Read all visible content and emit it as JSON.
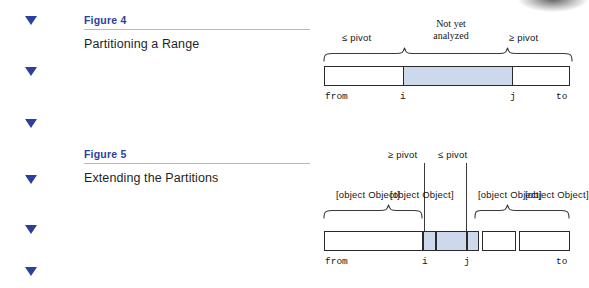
{
  "margin_markers": {
    "icon": "triangle-down-icon",
    "color": "#2b3f9e",
    "count": 6
  },
  "figures": [
    {
      "heading": "Figure 4",
      "title": "Partitioning a Range",
      "diagram": {
        "type": "partition-range-diagram",
        "top_labels": [
          {
            "text": "≤ pivot",
            "style": "sans"
          },
          {
            "text": "Not yet",
            "text2": "analyzed",
            "style": "serif"
          },
          {
            "text": "≥ pivot",
            "style": "sans"
          }
        ],
        "bottom_labels": [
          "from",
          "i",
          "j",
          "to"
        ],
        "segments": [
          {
            "name": "less-equal-pivot",
            "shaded": false
          },
          {
            "name": "not-yet-analyzed",
            "shaded": true
          },
          {
            "name": "greater-equal-pivot",
            "shaded": false
          }
        ],
        "shade_color": "#ccd9ec"
      }
    },
    {
      "heading": "Figure 5",
      "title": "Extending the Partitions",
      "diagram": {
        "type": "extending-partitions-diagram",
        "callout_labels": [
          {
            "text": "≥ pivot"
          },
          {
            "text": "≤ pivot"
          }
        ],
        "brace_labels": [
          {
            "text": "≤ pivot"
          },
          {
            "text": "< pivot"
          },
          {
            "text": "> pivot"
          },
          {
            "text": "≥ pivot"
          }
        ],
        "bottom_labels": [
          "from",
          "i",
          "j",
          "to"
        ],
        "segments": [
          {
            "name": "left-partition",
            "shaded": false
          },
          {
            "name": "cell-i",
            "shaded": true
          },
          {
            "name": "cell-middle",
            "shaded": true
          },
          {
            "name": "cell-j",
            "shaded": true
          },
          {
            "name": "right-small",
            "shaded": false
          },
          {
            "name": "right-partition",
            "shaded": false
          }
        ],
        "shade_color": "#ccd9ec"
      }
    }
  ]
}
